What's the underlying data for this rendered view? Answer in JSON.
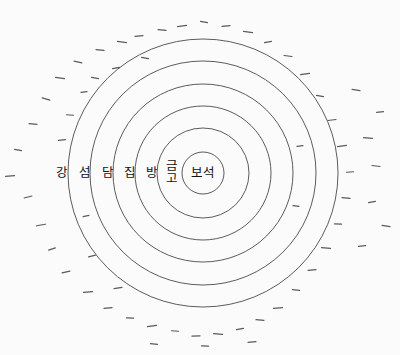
{
  "diagram": {
    "type": "concentric-containment",
    "background_color": "#fbfbfb",
    "stroke_color": "#4a4a4a",
    "center": {
      "x": 203,
      "y": 173
    },
    "labels": [
      {
        "id": "river",
        "text": "강",
        "x": 62,
        "y": 173,
        "stacked": false
      },
      {
        "id": "island",
        "text": "섬",
        "x": 85,
        "y": 173,
        "stacked": false
      },
      {
        "id": "wall",
        "text": "담",
        "x": 108,
        "y": 173,
        "stacked": false
      },
      {
        "id": "house",
        "text": "집",
        "x": 130,
        "y": 173,
        "stacked": false
      },
      {
        "id": "room",
        "text": "방",
        "x": 152,
        "y": 173,
        "stacked": false
      },
      {
        "id": "safe",
        "text": "금고",
        "x": 172,
        "y": 173,
        "stacked": true,
        "line1": "금",
        "line2": "고"
      },
      {
        "id": "jewel",
        "text": "보석",
        "x": 203,
        "y": 173,
        "stacked": false
      }
    ],
    "rings": [
      {
        "id": "ring-river",
        "rx": 135,
        "ry": 134
      },
      {
        "id": "ring-island",
        "rx": 113,
        "ry": 112
      },
      {
        "id": "ring-wall",
        "rx": 90,
        "ry": 89
      },
      {
        "id": "ring-house",
        "rx": 68,
        "ry": 67
      },
      {
        "id": "ring-room",
        "rx": 46,
        "ry": 45
      },
      {
        "id": "ring-safe",
        "rx": 21,
        "ry": 21
      }
    ],
    "speckles": [
      {
        "x": 10,
        "y": 176,
        "len": 9,
        "rot": -4
      },
      {
        "x": 18,
        "y": 150,
        "len": 7,
        "rot": 10
      },
      {
        "x": 28,
        "y": 197,
        "len": 8,
        "rot": -14
      },
      {
        "x": 33,
        "y": 124,
        "len": 8,
        "rot": 6
      },
      {
        "x": 41,
        "y": 225,
        "len": 9,
        "rot": -10
      },
      {
        "x": 46,
        "y": 99,
        "len": 8,
        "rot": 16
      },
      {
        "x": 52,
        "y": 249,
        "len": 7,
        "rot": -18
      },
      {
        "x": 60,
        "y": 78,
        "len": 9,
        "rot": 8
      },
      {
        "x": 62,
        "y": 140,
        "len": 7,
        "rot": -6
      },
      {
        "x": 66,
        "y": 272,
        "len": 8,
        "rot": -12
      },
      {
        "x": 70,
        "y": 115,
        "len": 7,
        "rot": 4
      },
      {
        "x": 78,
        "y": 62,
        "len": 8,
        "rot": 12
      },
      {
        "x": 84,
        "y": 92,
        "len": 6,
        "rot": -8
      },
      {
        "x": 88,
        "y": 292,
        "len": 9,
        "rot": -6
      },
      {
        "x": 95,
        "y": 78,
        "len": 7,
        "rot": 9
      },
      {
        "x": 100,
        "y": 50,
        "len": 8,
        "rot": 5
      },
      {
        "x": 108,
        "y": 308,
        "len": 8,
        "rot": -4
      },
      {
        "x": 116,
        "y": 68,
        "len": 7,
        "rot": -10
      },
      {
        "x": 122,
        "y": 42,
        "len": 9,
        "rot": 7
      },
      {
        "x": 130,
        "y": 318,
        "len": 7,
        "rot": 3
      },
      {
        "x": 139,
        "y": 36,
        "len": 8,
        "rot": -5
      },
      {
        "x": 145,
        "y": 58,
        "len": 7,
        "rot": 11
      },
      {
        "x": 152,
        "y": 326,
        "len": 9,
        "rot": -8
      },
      {
        "x": 162,
        "y": 30,
        "len": 8,
        "rot": 6
      },
      {
        "x": 175,
        "y": 331,
        "len": 7,
        "rot": 4
      },
      {
        "x": 182,
        "y": 26,
        "len": 9,
        "rot": -7
      },
      {
        "x": 196,
        "y": 336,
        "len": 8,
        "rot": -3
      },
      {
        "x": 204,
        "y": 22,
        "len": 7,
        "rot": 9
      },
      {
        "x": 218,
        "y": 334,
        "len": 9,
        "rot": 5
      },
      {
        "x": 226,
        "y": 26,
        "len": 8,
        "rot": -6
      },
      {
        "x": 240,
        "y": 329,
        "len": 7,
        "rot": -10
      },
      {
        "x": 248,
        "y": 32,
        "len": 9,
        "rot": 8
      },
      {
        "x": 260,
        "y": 320,
        "len": 8,
        "rot": 4
      },
      {
        "x": 268,
        "y": 42,
        "len": 7,
        "rot": -9
      },
      {
        "x": 278,
        "y": 308,
        "len": 9,
        "rot": -5
      },
      {
        "x": 288,
        "y": 56,
        "len": 8,
        "rot": 7
      },
      {
        "x": 296,
        "y": 290,
        "len": 7,
        "rot": 6
      },
      {
        "x": 305,
        "y": 74,
        "len": 9,
        "rot": -8
      },
      {
        "x": 312,
        "y": 270,
        "len": 8,
        "rot": -4
      },
      {
        "x": 320,
        "y": 96,
        "len": 7,
        "rot": 10
      },
      {
        "x": 326,
        "y": 248,
        "len": 9,
        "rot": 5
      },
      {
        "x": 332,
        "y": 120,
        "len": 8,
        "rot": -7
      },
      {
        "x": 338,
        "y": 224,
        "len": 7,
        "rot": 3
      },
      {
        "x": 342,
        "y": 146,
        "len": 9,
        "rot": -9
      },
      {
        "x": 346,
        "y": 198,
        "len": 8,
        "rot": 6
      },
      {
        "x": 350,
        "y": 172,
        "len": 7,
        "rot": -4
      },
      {
        "x": 356,
        "y": 90,
        "len": 8,
        "rot": 8
      },
      {
        "x": 362,
        "y": 246,
        "len": 7,
        "rot": -6
      },
      {
        "x": 368,
        "y": 138,
        "len": 9,
        "rot": 4
      },
      {
        "x": 372,
        "y": 202,
        "len": 7,
        "rot": -11
      },
      {
        "x": 376,
        "y": 166,
        "len": 8,
        "rot": 7
      },
      {
        "x": 380,
        "y": 112,
        "len": 7,
        "rot": -5
      },
      {
        "x": 386,
        "y": 226,
        "len": 8,
        "rot": 9
      },
      {
        "x": 92,
        "y": 256,
        "len": 7,
        "rot": -14
      },
      {
        "x": 118,
        "y": 288,
        "len": 8,
        "rot": -9
      },
      {
        "x": 205,
        "y": 346,
        "len": 7,
        "rot": 2
      },
      {
        "x": 252,
        "y": 342,
        "len": 8,
        "rot": -4
      },
      {
        "x": 154,
        "y": 344,
        "len": 7,
        "rot": 5
      },
      {
        "x": 300,
        "y": 146,
        "len": 6,
        "rot": -7
      },
      {
        "x": 296,
        "y": 206,
        "len": 6,
        "rot": 6
      },
      {
        "x": 86,
        "y": 216,
        "len": 6,
        "rot": -12
      }
    ]
  }
}
